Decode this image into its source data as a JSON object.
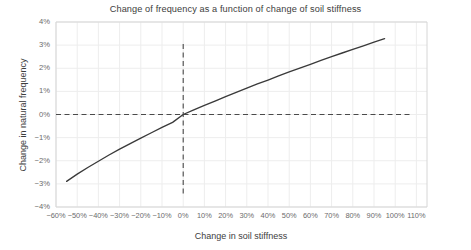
{
  "chart_data": {
    "type": "line",
    "title": "Change of frequency as a function of change of soil stiffness",
    "xlabel": "Change in soil stiffness",
    "ylabel": "Change in natural frequency",
    "xlim": [
      -60,
      115
    ],
    "ylim": [
      -4,
      4
    ],
    "grid": true,
    "legend": null,
    "x_tick_labels": [
      "−60%",
      "−50%",
      "−40%",
      "−30%",
      "−20%",
      "−10%",
      "0%",
      "10%",
      "20%",
      "30%",
      "40%",
      "50%",
      "60%",
      "70%",
      "80%",
      "90%",
      "100%",
      "110%"
    ],
    "x_tick_values": [
      -60,
      -50,
      -40,
      -30,
      -20,
      -10,
      0,
      10,
      20,
      30,
      40,
      50,
      60,
      70,
      80,
      90,
      100,
      110
    ],
    "y_tick_labels": [
      "4%",
      "3%",
      "2%",
      "1%",
      "0%",
      "−1%",
      "−2%",
      "−3%",
      "−4%"
    ],
    "y_tick_values": [
      4,
      3,
      2,
      1,
      0,
      -1,
      -2,
      -3,
      -4
    ],
    "series": [
      {
        "name": "frequency-change-curve",
        "color": "#3a3a3a",
        "x": [
          -55,
          -50,
          -45,
          -40,
          -35,
          -30,
          -25,
          -20,
          -15,
          -10,
          -5,
          0,
          5,
          10,
          15,
          20,
          25,
          30,
          35,
          40,
          45,
          50,
          55,
          60,
          65,
          70,
          75,
          80,
          85,
          90,
          95
        ],
        "y": [
          -2.89,
          -2.58,
          -2.29,
          -2.02,
          -1.75,
          -1.5,
          -1.26,
          -1.02,
          -0.79,
          -0.56,
          -0.34,
          0.0,
          0.2,
          0.39,
          0.58,
          0.77,
          0.96,
          1.14,
          1.32,
          1.49,
          1.67,
          1.84,
          2.01,
          2.17,
          2.34,
          2.5,
          2.66,
          2.82,
          2.97,
          3.13,
          3.28
        ]
      }
    ],
    "reference_lines": [
      {
        "name": "zero-frequency-line",
        "orientation": "horizontal",
        "value": 0,
        "style": "dashed",
        "color": "#4a4a4a"
      },
      {
        "name": "zero-stiffness-line",
        "orientation": "vertical",
        "value": 0,
        "style": "dashed",
        "color": "#4a4a4a"
      }
    ],
    "colors": {
      "curve": "#3a3a3a",
      "grid": "#ededed",
      "axis": "#d6d6d6",
      "text": "#4a4a4a",
      "background": "#ffffff"
    }
  }
}
